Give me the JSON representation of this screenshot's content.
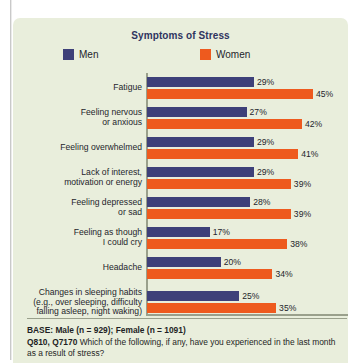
{
  "panel": {
    "background_color": "#E9EEDC"
  },
  "chart_title": "Symptoms of Stress",
  "legend": {
    "men": {
      "label": "Men",
      "color": "#3E4079"
    },
    "women": {
      "label": "Women",
      "color": "#EE5A1E"
    }
  },
  "footnote": {
    "base": "BASE: Male (n = 929); Female (n = 1091)",
    "question_code": "Q810, Q7170",
    "question_text": "Which of the following, if any, have you experienced in the last month as a result of stress?"
  },
  "chart_data": {
    "type": "bar",
    "orientation": "horizontal",
    "title": "Symptoms of Stress",
    "xlabel": "",
    "ylabel": "",
    "xlim": [
      0,
      50
    ],
    "grid": false,
    "legend_position": "top",
    "value_suffix": "%",
    "categories": [
      "Fatigue",
      "Feeling nervous or anxious",
      "Feeling overwhelmed",
      "Lack of interest, motivation or energy",
      "Feeling depressed or sad",
      "Feeling as though I could cry",
      "Headache",
      "Changes in sleeping habits (e.g., over sleeping, difficulty falling asleep, night waking)"
    ],
    "category_lines": [
      [
        "Fatigue"
      ],
      [
        "Feeling nervous",
        "or anxious"
      ],
      [
        "Feeling overwhelmed"
      ],
      [
        "Lack of interest,",
        "motivation or energy"
      ],
      [
        "Feeling depressed",
        "or sad"
      ],
      [
        "Feeling as though",
        "I could cry"
      ],
      [
        "Headache"
      ],
      [
        "Changes in sleeping habits",
        "(e.g., over sleeping, difficulty",
        "falling asleep, night waking)"
      ]
    ],
    "series": [
      {
        "name": "Men",
        "color": "#3E4079",
        "values": [
          29,
          27,
          29,
          29,
          28,
          17,
          20,
          25
        ],
        "labels": [
          "29%",
          "27%",
          "29%",
          "29%",
          "28%",
          "17%",
          "20%",
          "25%"
        ]
      },
      {
        "name": "Women",
        "color": "#EE5A1E",
        "values": [
          45,
          42,
          41,
          39,
          39,
          38,
          34,
          35
        ],
        "labels": [
          "45%",
          "42%",
          "41%",
          "39%",
          "39%",
          "38%",
          "34%",
          "35%"
        ]
      }
    ]
  }
}
